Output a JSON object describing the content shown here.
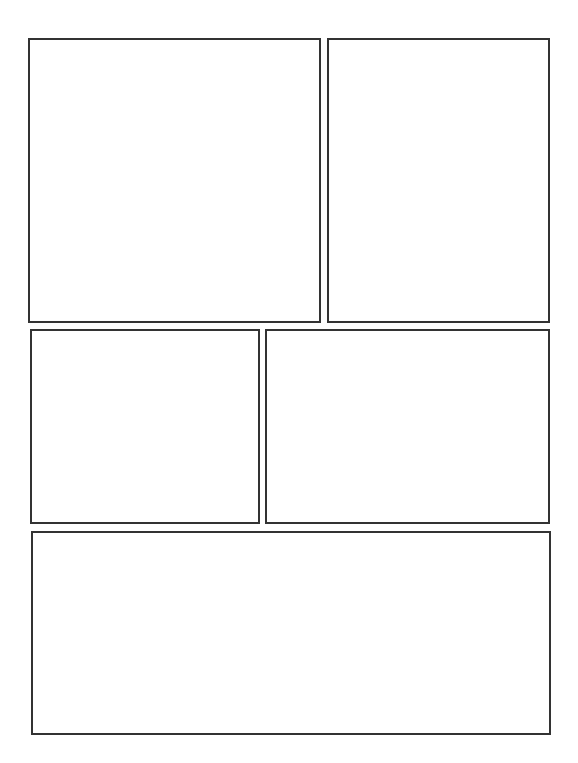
{
  "page": {
    "type": "comic-panel-template",
    "background": "#ffffff",
    "border_color": "#333333",
    "panels": [
      {
        "id": "panel-1",
        "row": 1,
        "position": "left",
        "content": ""
      },
      {
        "id": "panel-2",
        "row": 1,
        "position": "right",
        "content": ""
      },
      {
        "id": "panel-3",
        "row": 2,
        "position": "left",
        "content": ""
      },
      {
        "id": "panel-4",
        "row": 2,
        "position": "right",
        "content": ""
      },
      {
        "id": "panel-5",
        "row": 3,
        "position": "full-width",
        "content": ""
      }
    ]
  }
}
